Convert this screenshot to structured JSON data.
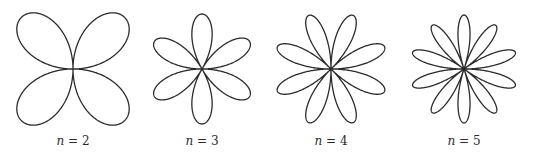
{
  "figure": {
    "stroke_color": "#2b2b2b",
    "stroke_width": 1.3,
    "panels": [
      {
        "n": 2,
        "var": "n",
        "eq": " = ",
        "value": "2",
        "cx": 73,
        "cy": 69,
        "radius": 73,
        "petals": 4,
        "rotation_deg": 45
      },
      {
        "n": 3,
        "var": "n",
        "eq": " = ",
        "value": "3",
        "cx": 202,
        "cy": 69,
        "radius": 55,
        "petals": 6,
        "rotation_deg": 90
      },
      {
        "n": 4,
        "var": "n",
        "eq": " = ",
        "value": "4",
        "cx": 331,
        "cy": 69,
        "radius": 58,
        "petals": 8,
        "rotation_deg": 22.5
      },
      {
        "n": 5,
        "var": "n",
        "eq": " = ",
        "value": "5",
        "cx": 464,
        "cy": 69,
        "radius": 54,
        "petals": 10,
        "rotation_deg": 90
      }
    ]
  }
}
